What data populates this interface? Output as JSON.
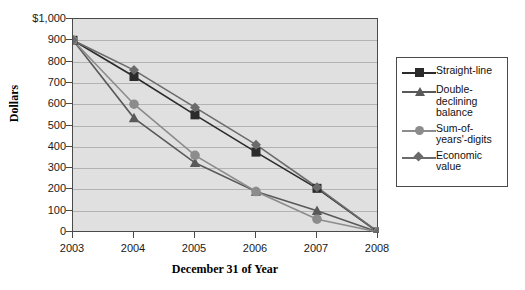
{
  "chart_data": {
    "type": "line",
    "title": "",
    "xlabel": "December 31 of Year",
    "ylabel": "Dollars",
    "categories": [
      "2003",
      "2004",
      "2005",
      "2006",
      "2007",
      "2008"
    ],
    "x": [
      2003,
      2004,
      2005,
      2006,
      2007,
      2008
    ],
    "ylim": [
      0,
      1000
    ],
    "ytick_labels": [
      "$1,000",
      "900",
      "800",
      "700",
      "600",
      "500",
      "400",
      "300",
      "200",
      "100",
      "0"
    ],
    "ytick_values": [
      1000,
      900,
      800,
      700,
      600,
      500,
      400,
      300,
      200,
      100,
      0
    ],
    "grid": true,
    "legend_position": "right",
    "series": [
      {
        "name": "Straight-line",
        "marker": "square",
        "color": "#2b2b2b",
        "values": [
          900,
          730,
          550,
          375,
          205,
          0
        ]
      },
      {
        "name": "Double-declining balance",
        "marker": "triangle",
        "color": "#595959",
        "values": [
          900,
          535,
          325,
          190,
          100,
          0
        ]
      },
      {
        "name": "Sum-of-years'-digits",
        "marker": "circle",
        "color": "#8c8c8c",
        "values": [
          900,
          600,
          360,
          190,
          60,
          0
        ]
      },
      {
        "name": "Economic value",
        "marker": "diamond",
        "color": "#6b6b6b",
        "values": [
          900,
          760,
          585,
          410,
          210,
          0
        ]
      }
    ]
  },
  "legend": {
    "entries": [
      {
        "label": "Straight-line"
      },
      {
        "label": "Double-declining balance"
      },
      {
        "label": "Sum-of-years'-digits"
      },
      {
        "label": "Economic value"
      }
    ]
  },
  "colors": {
    "plot_background": "#e0e0e0",
    "plot_border": "#4a4a4a",
    "gridline": "#b3b3b3",
    "page_background": "#ffffff",
    "text": "#1a1a1a"
  }
}
